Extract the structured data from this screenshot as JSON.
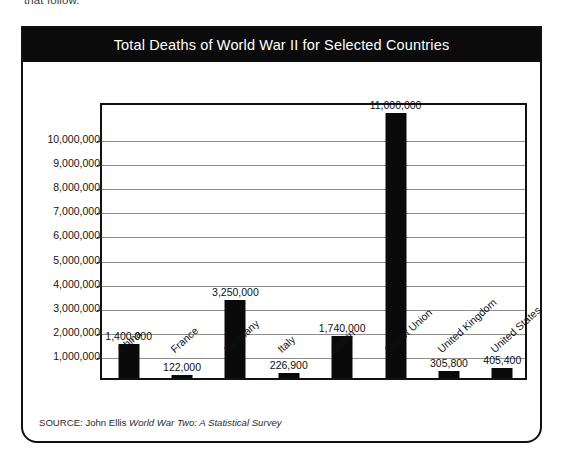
{
  "page": {
    "top_fragment": "that follow."
  },
  "figure": {
    "title": "Total Deaths of World War II for Selected Countries",
    "source_prefix": "SOURCE: John Ellis ",
    "source_book": "World War Two: A Statistical Survey",
    "colors": {
      "title_bar": "#0b0b0b",
      "title_text": "#ffffff",
      "bar": "#0a0a0a",
      "gridline": "#8d8d8d",
      "frame": "#111111",
      "background": "#ffffff"
    }
  },
  "chart_data": {
    "type": "bar",
    "title": "Total Deaths of World War II for Selected Countries",
    "xlabel": "",
    "ylabel": "",
    "categories": [
      "China",
      "France",
      "Germany",
      "Italy",
      "Japan",
      "Soviet Union",
      "United Kingdom",
      "United States"
    ],
    "values": [
      1400000,
      122000,
      3250000,
      226900,
      1740000,
      11000000,
      305800,
      405400
    ],
    "value_labels": [
      "1,400,000",
      "122,000",
      "3,250,000",
      "226,900",
      "1,740,000",
      "11,000,000",
      "305,800",
      "405,400"
    ],
    "ylim": [
      0,
      11500000
    ],
    "ytick_values": [
      1000000,
      2000000,
      3000000,
      4000000,
      5000000,
      6000000,
      7000000,
      8000000,
      9000000,
      10000000
    ],
    "ytick_labels": [
      "1,000,000",
      "2,000,000",
      "3,000,000",
      "4,000,000",
      "5,000,000",
      "6,000,000",
      "7,000,000",
      "8,000,000",
      "9,000,000",
      "10,000,000"
    ],
    "grid": true,
    "legend": false,
    "data_labels": true,
    "category_label_rotation_deg": -42
  }
}
